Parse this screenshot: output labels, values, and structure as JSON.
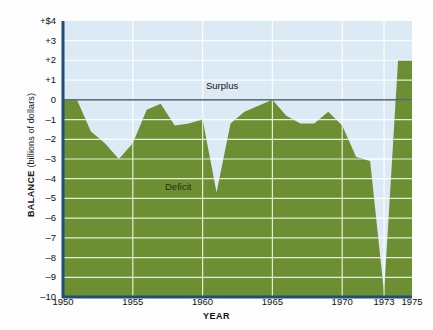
{
  "chart_data": {
    "type": "area",
    "title": "",
    "xlabel": "YEAR",
    "ylabel": "BALANCE (billions of dollars)",
    "ylabel_bold": "BALANCE",
    "ylabel_thin": "(billions of dollars)",
    "xlim": [
      1950,
      1975
    ],
    "ylim": [
      -10,
      4
    ],
    "xticks": [
      1950,
      1955,
      1960,
      1965,
      1970,
      1973,
      1975
    ],
    "xtick_labels": [
      "1950",
      "1955",
      "1960",
      "1965",
      "1970",
      "1973",
      "1975"
    ],
    "yticks": [
      4,
      3,
      2,
      1,
      0,
      -1,
      -2,
      -3,
      -4,
      -5,
      -6,
      -7,
      -8,
      -9,
      -10
    ],
    "ytick_labels": [
      "+$4",
      "+3",
      "+2",
      "+1",
      "0",
      "–1",
      "–2",
      "–3",
      "–4",
      "–5",
      "–6",
      "–7",
      "–8",
      "–9",
      "–10"
    ],
    "grid": true,
    "grid_color": "#ffffff",
    "legend": null,
    "annotations": [
      {
        "text": "Surplus",
        "x": 1962.5,
        "y": 0.6
      },
      {
        "text": "Deficit",
        "x": 1957.5,
        "y": -5.1
      }
    ],
    "series": [
      {
        "name": "Federal budget balance",
        "fill_color": "#6c8f34",
        "baseline": -10,
        "x": [
          1950,
          1951,
          1952,
          1953,
          1954,
          1955,
          1956,
          1957,
          1958,
          1959,
          1960,
          1961,
          1962,
          1963,
          1964,
          1965,
          1966,
          1967,
          1968,
          1969,
          1970,
          1971,
          1972,
          1973,
          1974,
          1975
        ],
        "values": [
          0.0,
          0.0,
          -1.6,
          -2.2,
          -3.0,
          -2.2,
          -0.5,
          -0.2,
          -1.3,
          -1.2,
          -1.0,
          -4.7,
          -1.2,
          -0.6,
          -0.3,
          0.0,
          -0.8,
          -1.2,
          -1.2,
          -0.6,
          -1.3,
          -2.9,
          -3.1,
          -9.8,
          2.0,
          2.0
        ]
      }
    ]
  },
  "axis_colors": {
    "plot_background": "#dbeaf5",
    "area_fill": "#6c8f34",
    "axis_line": "#1f4e79",
    "zero_line": "#2c4556",
    "grid": "#ffffff"
  }
}
